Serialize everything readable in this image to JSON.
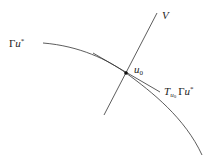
{
  "diagram": {
    "labels": {
      "curve": "Γu*",
      "curve_main": "Γ",
      "curve_var": "u",
      "curve_sup": "*",
      "line_v": "V",
      "point": "u",
      "point_sub": "0",
      "tangent_T": "T",
      "tangent_sub_u": "u",
      "tangent_sub_0": "0",
      "tangent_gamma": "Γ",
      "tangent_var": "u",
      "tangent_sup": "*"
    },
    "colors": {
      "stroke": "#333333",
      "text": "#222222",
      "background": "#ffffff"
    }
  }
}
